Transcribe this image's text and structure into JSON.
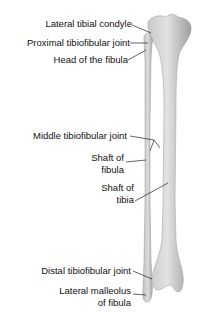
{
  "figure": {
    "bone_color": "#d4d4d4",
    "bone_shade": "#a8a8a8",
    "line_color": "#222222"
  },
  "labels": [
    {
      "id": "lateral-tibial-condyle",
      "text": "Lateral tibial condyle"
    },
    {
      "id": "proximal-tibiofibular-joint",
      "text": "Proximal tibiofibular joint"
    },
    {
      "id": "head-of-fibula",
      "text": "Head of the fibula"
    },
    {
      "id": "middle-tibiofibular-joint",
      "text": "Middle tibiofibular joint"
    },
    {
      "id": "shaft-of-fibula-1",
      "text": "Shaft of"
    },
    {
      "id": "shaft-of-fibula-2",
      "text": "fibula"
    },
    {
      "id": "shaft-of-tibia-1",
      "text": "Shaft of"
    },
    {
      "id": "shaft-of-tibia-2",
      "text": "tibia"
    },
    {
      "id": "distal-tibiofibular-joint",
      "text": "Distal tibiofibular joint"
    },
    {
      "id": "lateral-malleolus-1",
      "text": "Lateral malleolus"
    },
    {
      "id": "lateral-malleolus-2",
      "text": "of fibula"
    }
  ]
}
